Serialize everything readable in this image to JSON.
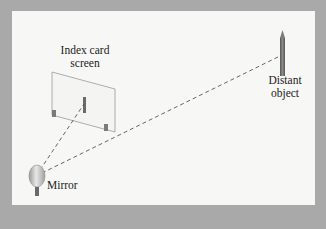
{
  "diagram": {
    "labels": {
      "index_card_line1": "Index card",
      "index_card_line2": "screen",
      "distant_object_line1": "Distant",
      "distant_object_line2": "object",
      "mirror": "Mirror"
    },
    "colors": {
      "frame": "#a9a9a9",
      "panel": "#f7f7f5",
      "line": "#555555",
      "card_outline": "#9a9a9a",
      "object": "#6e6e6e"
    }
  }
}
